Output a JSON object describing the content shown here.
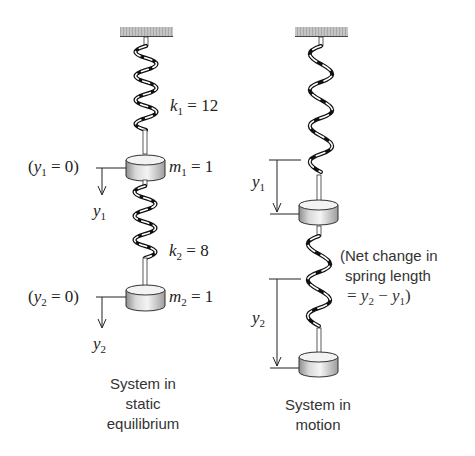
{
  "left_panel": {
    "spring1": {
      "symbol": "k",
      "subscript": "1",
      "value": "= 12"
    },
    "mass1": {
      "symbol": "m",
      "subscript": "1",
      "value": "= 1"
    },
    "ref1": {
      "open": "(",
      "symbol": "y",
      "subscript": "1",
      "value": " = 0)"
    },
    "axis1": {
      "symbol": "y",
      "subscript": "1"
    },
    "spring2": {
      "symbol": "k",
      "subscript": "2",
      "value": "= 8"
    },
    "mass2": {
      "symbol": "m",
      "subscript": "2",
      "value": "= 1"
    },
    "ref2": {
      "open": "(",
      "symbol": "y",
      "subscript": "2",
      "value": " = 0)"
    },
    "axis2": {
      "symbol": "y",
      "subscript": "2"
    },
    "caption": {
      "line1": "System in",
      "line2": "static",
      "line3": "equilibrium"
    }
  },
  "right_panel": {
    "disp1": {
      "symbol": "y",
      "subscript": "1"
    },
    "disp2": {
      "symbol": "y",
      "subscript": "2"
    },
    "note": {
      "line1": "(Net change in",
      "line2": "spring length",
      "line3_prefix": "= ",
      "y2": "y",
      "y2_sub": "2",
      "minus": " − ",
      "y1": "y",
      "y1_sub": "1",
      "close": ")"
    },
    "caption": {
      "line1": "System in",
      "line2": "motion"
    }
  },
  "colors": {
    "ceiling": "#b8b8b8",
    "spring_dark": "#111111",
    "mass_light": "#f2f2f2",
    "mass_dark": "#9a9a9a",
    "text": "#222222"
  }
}
